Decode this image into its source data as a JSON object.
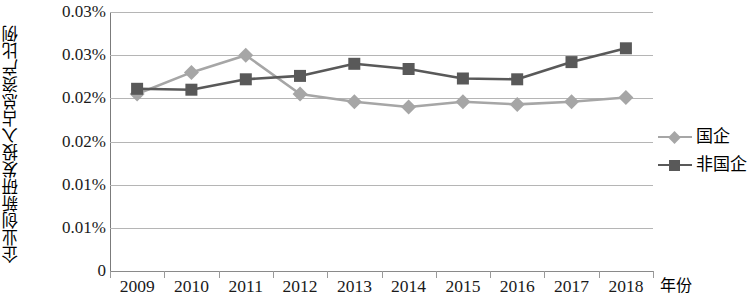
{
  "chart_data": {
    "type": "line",
    "title": "",
    "xlabel": "年份",
    "ylabel": "企业创新研发投入占总资产比例",
    "categories": [
      "2009",
      "2010",
      "2011",
      "2012",
      "2013",
      "2014",
      "2015",
      "2016",
      "2017",
      "2018"
    ],
    "x": [
      2009,
      2010,
      2011,
      2012,
      2013,
      2014,
      2015,
      2016,
      2017,
      2018
    ],
    "series": [
      {
        "name": "国企",
        "marker": "diamond",
        "color": "#A6A6A6",
        "values": [
          0.0205,
          0.023,
          0.025,
          0.0205,
          0.0196,
          0.019,
          0.0196,
          0.0193,
          0.0196,
          0.0201
        ]
      },
      {
        "name": "非国企",
        "marker": "square",
        "color": "#595959",
        "values": [
          0.0211,
          0.021,
          0.0222,
          0.0226,
          0.024,
          0.0234,
          0.0223,
          0.0222,
          0.0242,
          0.0258
        ]
      }
    ],
    "ytick_labels": [
      "0.03%",
      "0.03%",
      "0.02%",
      "0.02%",
      "0.01%",
      "0.01%",
      "0"
    ],
    "ytick_values": [
      0.03,
      0.025,
      0.02,
      0.015,
      0.01,
      0.005,
      0.0
    ],
    "ylim": [
      0,
      0.03
    ],
    "grid": true,
    "legend_position": "right"
  },
  "legend": {
    "items": [
      {
        "label": "国企",
        "color": "#A6A6A6",
        "marker": "diamond"
      },
      {
        "label": "非国企",
        "color": "#595959",
        "marker": "square"
      }
    ]
  },
  "axes": {
    "y_title": "企业创新研发投入占总资产比例",
    "x_title": "年份"
  },
  "colors": {
    "series_soe": "#A6A6A6",
    "series_nonsoe": "#595959",
    "gridline": "#B5B5B5",
    "axis": "#8A8A8A",
    "text": "#1A1A1A",
    "background": "#FFFFFF"
  }
}
